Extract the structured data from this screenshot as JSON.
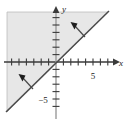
{
  "figure": {
    "kind": "inequality-graph",
    "background_color": "#ffffff",
    "shade_color": "#e7e7e7",
    "shade_border_color": "#bdbdbd",
    "axis_color": "#3a3a3a",
    "line_color": "#4a4a4a",
    "arrow_color": "#2b2b2b"
  },
  "axes": {
    "x_label": "x",
    "y_label": "y",
    "origin_px": {
      "x": 56,
      "y": 62
    },
    "tick_spacing_px": 7.4,
    "x_axis_start_px": 4,
    "x_axis_end_px": 118,
    "y_axis_start_px": 8,
    "y_axis_end_px": 118,
    "x_tick_count_negative": 7,
    "x_tick_count_positive": 8,
    "y_tick_count_positive": 7,
    "y_tick_count_negative": 7
  },
  "tick_labels": {
    "x": [
      {
        "value": "5",
        "x_px": 93,
        "y_px": 76
      }
    ],
    "y": [
      {
        "value": "−5",
        "x_px": 43,
        "y_px": 103
      }
    ]
  },
  "boundary_line": {
    "description": "solid diagonal boundary line y = x",
    "slope": 1,
    "intercept": 0,
    "style": "solid",
    "from_px": {
      "x": 6,
      "y": 112
    },
    "to_px": {
      "x": 109,
      "y": 11
    }
  },
  "shaded_region": {
    "description": "region above and to the left of the line y = x",
    "inequality": "y ≥ x",
    "polygon_px": "7,12 108,12 7,112"
  },
  "annotations": [
    {
      "name": "upper-shading-arrow",
      "description": "arrow from boundary line pointing up-left into shaded region",
      "tail_px": {
        "x": 85,
        "y": 37
      },
      "head_px": {
        "x": 73,
        "y": 24
      }
    },
    {
      "name": "lower-shading-arrow",
      "description": "arrow from boundary line pointing up-left into shaded region",
      "tail_px": {
        "x": 33,
        "y": 89
      },
      "head_px": {
        "x": 21,
        "y": 76
      }
    }
  ],
  "chart_data": {
    "type": "line",
    "title": "",
    "xlabel": "x",
    "ylabel": "y",
    "xlim": [
      -7,
      8
    ],
    "ylim": [
      -7,
      7
    ],
    "grid": false,
    "legend": "none",
    "series": [
      {
        "name": "boundary line y = x",
        "style": "solid",
        "x": [
          -7,
          7
        ],
        "y": [
          -7,
          7
        ]
      }
    ],
    "shaded_regions": [
      {
        "name": "solution set",
        "inequality": "y >= x",
        "fill": "#e7e7e7",
        "side": "above-left"
      }
    ],
    "xticks": [
      5
    ],
    "yticks": [
      -5
    ],
    "annotations": [
      "arrow into shaded region (upper)",
      "arrow into shaded region (lower)"
    ]
  }
}
